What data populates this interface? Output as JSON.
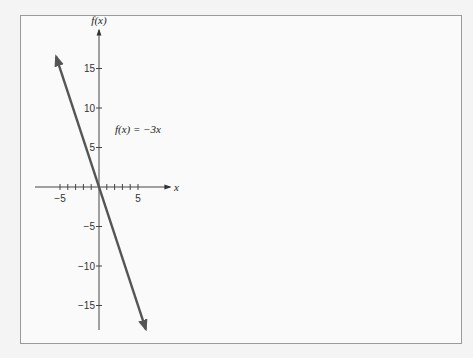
{
  "chart_data": {
    "type": "line",
    "title": "",
    "xlabel": "x",
    "ylabel": "f(x)",
    "annotation": "f(x) = −3x",
    "function": {
      "slope": -3,
      "intercept": 0
    },
    "series": [
      {
        "name": "f(x) = -3x",
        "x": [
          -5.5,
          6
        ],
        "y": [
          16.5,
          -18
        ]
      }
    ],
    "xlim": [
      -8,
      9
    ],
    "ylim": [
      -19,
      20
    ],
    "x_ticks": [
      -5,
      -4,
      -3,
      -2,
      -1,
      1,
      2,
      3,
      4,
      5
    ],
    "x_tick_labels": [
      {
        "value": -5,
        "label": "−5"
      },
      {
        "value": 5,
        "label": "5"
      }
    ],
    "y_ticks": [
      -15,
      -10,
      -5,
      5,
      10,
      15
    ],
    "y_tick_labels": [
      {
        "value": 15,
        "label": "15"
      },
      {
        "value": 10,
        "label": "10"
      },
      {
        "value": 5,
        "label": "5"
      },
      {
        "value": -5,
        "label": "−5"
      },
      {
        "value": -10,
        "label": "−10"
      },
      {
        "value": -15,
        "label": "−15"
      }
    ],
    "grid": false,
    "legend": "none",
    "line_color": "#555555",
    "axis_color": "#444444"
  }
}
